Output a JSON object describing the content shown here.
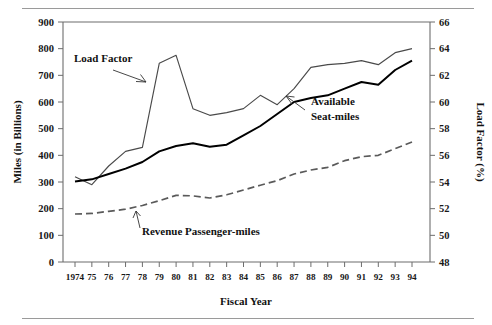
{
  "figure": {
    "has_top_rule": true,
    "has_bottom_rule": true,
    "rule_color": "#9a9a9a"
  },
  "chart_data": {
    "type": "line",
    "title": "",
    "xlabel": "Fiscal Year",
    "ylabel": "Miles (in Billions)",
    "y2label": "Load Factor (%)",
    "grid": false,
    "legend": "annotations",
    "x": [
      1974,
      1975,
      1976,
      1977,
      1978,
      1979,
      1980,
      1981,
      1982,
      1983,
      1984,
      1985,
      1986,
      1987,
      1988,
      1989,
      1990,
      1991,
      1992,
      1993,
      1994
    ],
    "xtick_labels": [
      "1974",
      "75",
      "76",
      "77",
      "78",
      "79",
      "80",
      "81",
      "82",
      "83",
      "84",
      "85",
      "86",
      "87",
      "88",
      "89",
      "90",
      "91",
      "92",
      "93",
      "94"
    ],
    "ylim": [
      0,
      900
    ],
    "ytick_labels": [
      "0",
      "100",
      "200",
      "300",
      "400",
      "500",
      "600",
      "700",
      "800",
      "900"
    ],
    "ytick_values": [
      0,
      100,
      200,
      300,
      400,
      500,
      600,
      700,
      800,
      900
    ],
    "y2lim": [
      48,
      66
    ],
    "y2tick_labels": [
      "48",
      "50",
      "52",
      "54",
      "56",
      "58",
      "60",
      "62",
      "64",
      "66"
    ],
    "y2tick_values": [
      48,
      50,
      52,
      54,
      56,
      58,
      60,
      62,
      64,
      66
    ],
    "series": [
      {
        "name": "Load Factor",
        "axis": "right",
        "unit": "%",
        "style": "solid-thin",
        "color": "#4a4a4a",
        "values": [
          54.4,
          53.8,
          55.2,
          56.3,
          56.6,
          62.9,
          63.5,
          59.5,
          59.0,
          59.2,
          59.5,
          60.5,
          59.8,
          61.0,
          62.6,
          62.8,
          62.9,
          63.1,
          62.8,
          63.7,
          64.0
        ]
      },
      {
        "name": "Available Seat-miles",
        "axis": "left",
        "unit": "billions of miles",
        "style": "solid-thick",
        "color": "#000000",
        "values": [
          302,
          310,
          330,
          350,
          375,
          415,
          435,
          445,
          432,
          440,
          475,
          510,
          555,
          600,
          615,
          625,
          650,
          675,
          665,
          720,
          755
        ]
      },
      {
        "name": "Revenue Passenger-miles",
        "axis": "left",
        "unit": "billions of miles",
        "style": "dashed",
        "color": "#5a5a5a",
        "values": [
          180,
          182,
          190,
          198,
          212,
          230,
          250,
          248,
          240,
          252,
          270,
          288,
          305,
          330,
          345,
          355,
          380,
          395,
          400,
          425,
          450
        ]
      }
    ],
    "annotations": [
      {
        "text": "Load Factor",
        "target_series": "Load Factor"
      },
      {
        "text": "Available",
        "target_series": "Available Seat-miles"
      },
      {
        "text": "Seat-miles",
        "target_series": "Available Seat-miles"
      },
      {
        "text": "Revenue Passenger-miles",
        "target_series": "Revenue Passenger-miles"
      }
    ]
  }
}
